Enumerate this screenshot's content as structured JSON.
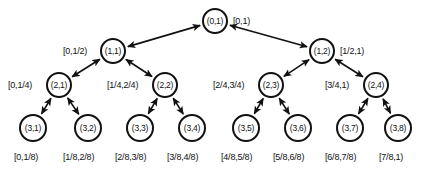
{
  "figure": {
    "type": "binary-interval-tree",
    "width": 436,
    "height": 169,
    "stroke_color": "#111111",
    "background_color": "#ffffff"
  },
  "nodes": [
    {
      "id": "n01",
      "label": "(0,1)",
      "cx": 215,
      "cy": 21,
      "r": 13,
      "level": 0
    },
    {
      "id": "n11",
      "label": "(1,1)",
      "cx": 113,
      "cy": 51,
      "r": 13,
      "level": 1
    },
    {
      "id": "n12",
      "label": "(1,2)",
      "cx": 322,
      "cy": 51,
      "r": 13,
      "level": 1
    },
    {
      "id": "n21",
      "label": "(2,1)",
      "cx": 59,
      "cy": 85,
      "r": 13,
      "level": 2
    },
    {
      "id": "n22",
      "label": "(2,2)",
      "cx": 165,
      "cy": 85,
      "r": 13,
      "level": 2
    },
    {
      "id": "n23",
      "label": "(2,3)",
      "cx": 271,
      "cy": 85,
      "r": 13,
      "level": 2
    },
    {
      "id": "n24",
      "label": "(2,4)",
      "cx": 376,
      "cy": 85,
      "r": 13,
      "level": 2
    },
    {
      "id": "n31",
      "label": "(3,1)",
      "cx": 33,
      "cy": 128,
      "r": 14,
      "level": 3
    },
    {
      "id": "n32",
      "label": "(3,2)",
      "cx": 88,
      "cy": 128,
      "r": 14,
      "level": 3
    },
    {
      "id": "n33",
      "label": "(3,3)",
      "cx": 140,
      "cy": 128,
      "r": 14,
      "level": 3
    },
    {
      "id": "n34",
      "label": "(3,4)",
      "cx": 192,
      "cy": 128,
      "r": 14,
      "level": 3
    },
    {
      "id": "n35",
      "label": "(3,5)",
      "cx": 246,
      "cy": 128,
      "r": 14,
      "level": 3
    },
    {
      "id": "n36",
      "label": "(3,6)",
      "cx": 298,
      "cy": 128,
      "r": 14,
      "level": 3
    },
    {
      "id": "n37",
      "label": "(3,7)",
      "cx": 350,
      "cy": 128,
      "r": 14,
      "level": 3
    },
    {
      "id": "n38",
      "label": "(3,8)",
      "cx": 398,
      "cy": 128,
      "r": 14,
      "level": 3
    }
  ],
  "interval_labels": [
    {
      "id": "i01",
      "text": "[0,1)",
      "x": 233,
      "y": 16,
      "for": "n01",
      "side": "right"
    },
    {
      "id": "i11",
      "text": "[0,1/2)",
      "x": 63,
      "y": 46,
      "for": "n11",
      "side": "left"
    },
    {
      "id": "i12",
      "text": "[1/2,1)",
      "x": 340,
      "y": 46,
      "for": "n12",
      "side": "right"
    },
    {
      "id": "i21",
      "text": "[0,1/4)",
      "x": 8,
      "y": 80,
      "for": "n21",
      "side": "left"
    },
    {
      "id": "i22",
      "text": "[1/4,2/4)",
      "x": 107,
      "y": 80,
      "for": "n22",
      "side": "left"
    },
    {
      "id": "i23",
      "text": "[2/4,3/4)",
      "x": 213,
      "y": 80,
      "for": "n23",
      "side": "left"
    },
    {
      "id": "i24",
      "text": "[3/4,1)",
      "x": 325,
      "y": 80,
      "for": "n24",
      "side": "left"
    },
    {
      "id": "i31",
      "text": "[0,1/8)",
      "x": 14,
      "y": 152,
      "for": "n31",
      "side": "below"
    },
    {
      "id": "i32",
      "text": "[1/8,2/8)",
      "x": 63,
      "y": 152,
      "for": "n32",
      "side": "below"
    },
    {
      "id": "i33",
      "text": "[2/8,3/8)",
      "x": 115,
      "y": 152,
      "for": "n33",
      "side": "below"
    },
    {
      "id": "i34",
      "text": "[3/8,4/8)",
      "x": 167,
      "y": 152,
      "for": "n34",
      "side": "below"
    },
    {
      "id": "i35",
      "text": "[4/8,5/8)",
      "x": 221,
      "y": 152,
      "for": "n35",
      "side": "below"
    },
    {
      "id": "i36",
      "text": "[5/8,6/8)",
      "x": 273,
      "y": 152,
      "for": "n36",
      "side": "below"
    },
    {
      "id": "i37",
      "text": "[6/8,7/8)",
      "x": 325,
      "y": 152,
      "for": "n37",
      "side": "below"
    },
    {
      "id": "i38",
      "text": "[7/8,1)",
      "x": 379,
      "y": 152,
      "for": "n38",
      "side": "below"
    }
  ],
  "edges": [
    {
      "id": "e-root-11",
      "from": "n01",
      "to": "n11",
      "bidirectional": true
    },
    {
      "id": "e-root-12",
      "from": "n01",
      "to": "n12",
      "bidirectional": true
    },
    {
      "id": "e-11-21",
      "from": "n11",
      "to": "n21",
      "bidirectional": true
    },
    {
      "id": "e-11-22",
      "from": "n11",
      "to": "n22",
      "bidirectional": true
    },
    {
      "id": "e-12-23",
      "from": "n12",
      "to": "n23",
      "bidirectional": true
    },
    {
      "id": "e-12-24",
      "from": "n12",
      "to": "n24",
      "bidirectional": true
    },
    {
      "id": "e-21-31",
      "from": "n21",
      "to": "n31",
      "bidirectional": true
    },
    {
      "id": "e-21-32",
      "from": "n21",
      "to": "n32",
      "bidirectional": true
    },
    {
      "id": "e-22-33",
      "from": "n22",
      "to": "n33",
      "bidirectional": true
    },
    {
      "id": "e-22-34",
      "from": "n22",
      "to": "n34",
      "bidirectional": true
    },
    {
      "id": "e-23-35",
      "from": "n23",
      "to": "n35",
      "bidirectional": true
    },
    {
      "id": "e-23-36",
      "from": "n23",
      "to": "n36",
      "bidirectional": true
    },
    {
      "id": "e-24-37",
      "from": "n24",
      "to": "n37",
      "bidirectional": true
    },
    {
      "id": "e-24-38",
      "from": "n24",
      "to": "n38",
      "bidirectional": true
    }
  ]
}
